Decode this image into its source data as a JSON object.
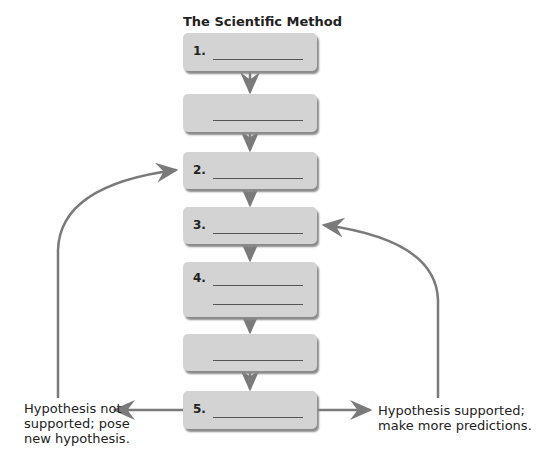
{
  "title": "The Scientific Method",
  "boxes": [
    {
      "label": "1."
    },
    {
      "label": ""
    },
    {
      "label": "2."
    },
    {
      "label": "3."
    },
    {
      "label": "4."
    },
    {
      "label": ""
    },
    {
      "label": "5."
    }
  ],
  "left_label": [
    "Hypothesis not",
    "supported; pose",
    "new hypothesis."
  ],
  "right_label": [
    "Hypothesis supported;",
    "make more predictions."
  ],
  "colors": {
    "box": "#d3d3d3",
    "arrow": "#7a7a7a"
  }
}
